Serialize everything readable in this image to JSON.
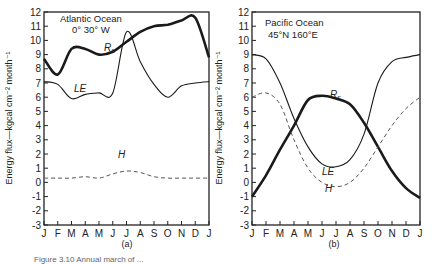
{
  "chart_data": [
    {
      "type": "line",
      "panel": "(a)",
      "title": "Atlantic Ocean",
      "subtitle": "0° 30° W",
      "xlabel": "",
      "ylabel": "Energy flux—kgcal cm⁻² month⁻¹",
      "x": [
        "J",
        "F",
        "M",
        "A",
        "M",
        "J",
        "J",
        "A",
        "S",
        "O",
        "N",
        "D",
        "J"
      ],
      "ylim": [
        -3,
        12
      ],
      "yticks": [
        -3,
        -2,
        -1,
        0,
        1,
        2,
        3,
        4,
        5,
        6,
        7,
        8,
        9,
        10,
        11,
        12
      ],
      "grid": false,
      "series": [
        {
          "name": "Rs",
          "style": "thick-solid",
          "values": [
            8.7,
            7.6,
            9.4,
            9.4,
            9.0,
            9.2,
            9.9,
            10.6,
            11.0,
            11.1,
            11.4,
            11.6,
            8.8
          ]
        },
        {
          "name": "LE",
          "style": "thin-solid",
          "values": [
            7.1,
            6.9,
            5.9,
            6.2,
            6.3,
            6.3,
            10.6,
            8.5,
            6.9,
            6.0,
            6.8,
            7.0,
            7.1
          ]
        },
        {
          "name": "H",
          "style": "dashed",
          "values": [
            0.3,
            0.3,
            0.3,
            0.4,
            0.3,
            0.6,
            0.8,
            0.7,
            0.4,
            0.3,
            0.3,
            0.3,
            0.3
          ]
        }
      ]
    },
    {
      "type": "line",
      "panel": "(b)",
      "title": "Pacific Ocean",
      "subtitle": "45°N 160°E",
      "xlabel": "",
      "ylabel": "Energy flux—kgcal cm⁻² month⁻¹",
      "x": [
        "J",
        "F",
        "M",
        "A",
        "M",
        "J",
        "J",
        "A",
        "S",
        "O",
        "N",
        "D",
        "J"
      ],
      "ylim": [
        -3,
        12
      ],
      "yticks": [
        -3,
        -2,
        -1,
        0,
        1,
        2,
        3,
        4,
        5,
        6,
        7,
        8,
        9,
        10,
        11,
        12
      ],
      "grid": false,
      "series": [
        {
          "name": "Rs",
          "style": "thick-solid",
          "values": [
            -1.0,
            0.5,
            2.3,
            4.0,
            5.8,
            6.1,
            5.9,
            5.5,
            4.2,
            2.5,
            0.8,
            -0.4,
            -1.1
          ]
        },
        {
          "name": "LE",
          "style": "thin-solid",
          "values": [
            9.0,
            8.7,
            7.0,
            4.5,
            2.5,
            1.3,
            1.1,
            1.6,
            3.4,
            7.0,
            8.5,
            8.8,
            9.0
          ]
        },
        {
          "name": "H",
          "style": "dashed",
          "values": [
            6.0,
            6.3,
            5.5,
            3.0,
            1.0,
            0.0,
            -0.3,
            0.0,
            1.0,
            2.5,
            4.0,
            5.2,
            6.0
          ]
        }
      ]
    }
  ],
  "panels": {
    "a": {
      "label": "(a)",
      "title": "Atlantic Ocean",
      "subtitle": "0° 30° W",
      "rs_label": "R",
      "rs_sub": "s",
      "le_label": "LE",
      "h_label": "H"
    },
    "b": {
      "label": "(b)",
      "title": "Pacific Ocean",
      "subtitle": "45°N 160°E",
      "rs_label": "R",
      "rs_sub": "s",
      "le_label": "LE",
      "h_label": "H"
    }
  },
  "ylabel": "Energy flux—kgcal cm⁻² month⁻¹",
  "caption": "Figure 3.10  Annual march of ..."
}
